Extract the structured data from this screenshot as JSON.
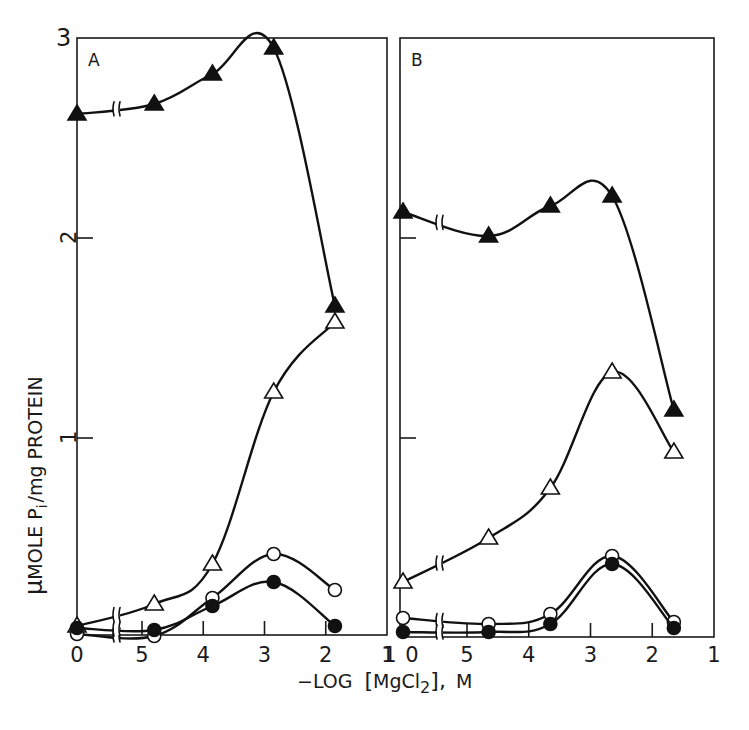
{
  "chart_data": {
    "type": "line",
    "title": "",
    "xlabel": "-LOG [MgCl2], M",
    "ylabel": "μMOLE Pi/mg PROTEIN",
    "ylim": [
      0,
      3
    ],
    "y_ticks": [
      "1",
      "2",
      "3"
    ],
    "x_tick_labels": [
      "0",
      "5",
      "4",
      "3",
      "2",
      "1"
    ],
    "x_axis_note": "axis break between 0 (no MgCl2) and 5",
    "grid": false,
    "legend": "none (series distinguished by marker: filled triangle, open triangle, open circle, filled circle)",
    "panels": [
      {
        "label": "A",
        "x": [
          0,
          4.8,
          3.85,
          2.85,
          1.85
        ],
        "x_display": [
          "0",
          "~4.8",
          "~3.85",
          "~2.85",
          "~1.85"
        ],
        "series": [
          {
            "name": "filled-triangle",
            "marker": "triangle-filled",
            "values": [
              2.62,
              2.67,
              2.82,
              2.95,
              1.66
            ]
          },
          {
            "name": "open-triangle",
            "marker": "triangle-open",
            "values": [
              0.06,
              0.17,
              0.37,
              1.23,
              1.58
            ]
          },
          {
            "name": "open-circle",
            "marker": "circle-open",
            "values": [
              0.02,
              0.01,
              0.2,
              0.42,
              0.24
            ]
          },
          {
            "name": "filled-circle",
            "marker": "circle-filled",
            "values": [
              0.05,
              0.04,
              0.16,
              0.28,
              0.06
            ]
          }
        ]
      },
      {
        "label": "B",
        "x": [
          0,
          4.65,
          3.65,
          2.65,
          1.65
        ],
        "x_display": [
          "0",
          "~4.65",
          "~3.65",
          "~2.65",
          "~1.65"
        ],
        "series": [
          {
            "name": "filled-triangle",
            "marker": "triangle-filled",
            "values": [
              2.13,
              2.01,
              2.16,
              2.21,
              1.14
            ]
          },
          {
            "name": "open-triangle",
            "marker": "triangle-open",
            "values": [
              0.28,
              0.5,
              0.75,
              1.33,
              0.93
            ]
          },
          {
            "name": "open-circle",
            "marker": "circle-open",
            "values": [
              0.1,
              0.07,
              0.12,
              0.41,
              0.08
            ]
          },
          {
            "name": "filled-circle",
            "marker": "circle-filled",
            "values": [
              0.03,
              0.03,
              0.07,
              0.37,
              0.05
            ]
          }
        ]
      }
    ]
  },
  "labels": {
    "panel_a": "A",
    "panel_b": "B",
    "y_tick_3": "3",
    "y_tick_2": "2",
    "y_tick_1": "1",
    "x_title_prefix": "−LOG",
    "x_title_bracket_open": "[",
    "x_title_mg": "MgCl",
    "x_title_sub": "2",
    "x_title_bracket_close": "],",
    "x_title_unit": "M",
    "y_title_mu": "μ",
    "y_title_mole": "MOLE P",
    "y_title_sub": "i",
    "y_title_rest": "/mg PROTEIN"
  },
  "colors": {
    "ink": "#111111",
    "background": "#ffffff"
  }
}
